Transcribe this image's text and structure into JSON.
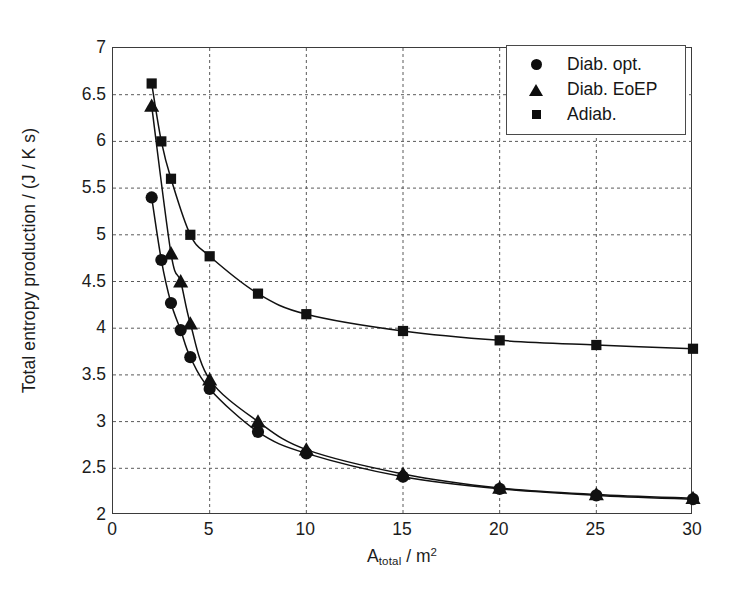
{
  "chart_data": {
    "type": "line",
    "title": "",
    "xlabel": "A_total / m^2",
    "xlabel_base": "A",
    "xlabel_sub": "total",
    "xlabel_rest": " / m",
    "xlabel_sup": "2",
    "ylabel": "Total entropy production / (J / K s)",
    "xlim": [
      0,
      30
    ],
    "ylim": [
      2,
      7
    ],
    "xticks": [
      0,
      5,
      10,
      15,
      20,
      25,
      30
    ],
    "yticks": [
      2,
      2.5,
      3,
      3.5,
      4,
      4.5,
      5,
      5.5,
      6,
      6.5,
      7
    ],
    "ytick_labels": [
      "2",
      "2.5",
      "3",
      "3.5",
      "4",
      "4.5",
      "5",
      "5.5",
      "6",
      "6.5",
      "7"
    ],
    "xtick_labels": [
      "0",
      "5",
      "10",
      "15",
      "20",
      "25",
      "30"
    ],
    "grid": true,
    "grid_style": "dashed",
    "legend_position": "top-right",
    "series": [
      {
        "name": "Diab. opt.",
        "marker": "circle",
        "color": "#111111",
        "x": [
          2,
          2.5,
          3,
          3.5,
          4,
          5,
          7.5,
          10,
          15,
          20,
          25,
          30
        ],
        "values": [
          5.4,
          4.73,
          4.27,
          3.98,
          3.69,
          3.35,
          2.89,
          2.66,
          2.41,
          2.28,
          2.21,
          2.17
        ]
      },
      {
        "name": "Diab. EoEP",
        "marker": "triangle",
        "color": "#111111",
        "x": [
          2,
          3,
          3.5,
          4,
          5,
          7.5,
          10,
          15,
          20,
          25,
          30
        ],
        "values": [
          6.38,
          4.8,
          4.5,
          4.05,
          3.45,
          3.0,
          2.7,
          2.44,
          2.29,
          2.22,
          2.18
        ]
      },
      {
        "name": "Adiab.",
        "marker": "square",
        "color": "#111111",
        "x": [
          2,
          2.5,
          3,
          4,
          5,
          7.5,
          10,
          15,
          20,
          25,
          30
        ],
        "values": [
          6.62,
          6.0,
          5.6,
          5.0,
          4.77,
          4.37,
          4.15,
          3.97,
          3.87,
          3.82,
          3.78
        ]
      }
    ]
  },
  "legend": {
    "items": [
      {
        "label": "Diab. opt.",
        "marker": "circle"
      },
      {
        "label": "Diab. EoEP",
        "marker": "triangle"
      },
      {
        "label": "Adiab.",
        "marker": "square"
      }
    ]
  }
}
